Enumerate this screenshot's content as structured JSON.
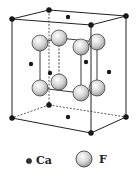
{
  "figure": {
    "colors": {
      "edge": "#222222",
      "ca": "#1a1a1a",
      "f_fill": "#d8d8d8",
      "f_stroke": "#333333"
    }
  },
  "legend": {
    "items": [
      {
        "symbol": "small-dark-sphere",
        "label": "Ca"
      },
      {
        "symbol": "large-light-sphere",
        "label": "F"
      }
    ]
  }
}
